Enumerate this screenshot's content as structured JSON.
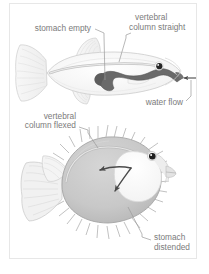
{
  "figure": {
    "frame_border_color": "#e7e7e7",
    "background_color": "#ffffff",
    "label_text_color": "#7b7b7b",
    "leader_line_color": "#9a9a9a",
    "labels": [
      {
        "id": "stomach-empty",
        "text": "stomach empty",
        "lines": [
          "stomach empty"
        ]
      },
      {
        "id": "vertebral-column-straight",
        "text": "vertebral column straight",
        "lines": [
          "vertebral",
          "column straight"
        ]
      },
      {
        "id": "water-flow",
        "text": "water flow",
        "lines": [
          "water flow"
        ]
      },
      {
        "id": "vertebral-column-flexed",
        "text": "vertebral column flexed",
        "lines": [
          "vertebral",
          "column flexed"
        ]
      },
      {
        "id": "stomach-distended",
        "text": "stomach distended",
        "lines": [
          "stomach",
          "distended"
        ]
      }
    ],
    "panels": [
      {
        "id": "uninflated-fish",
        "name": "uninflated pufferfish, lateral view",
        "body_fill": "#fbfbfb",
        "body_stroke": "#cfcfcf",
        "stomach_fill": "#5f5f5f",
        "eye_fill": "#2b2b2b",
        "state": "deflated"
      },
      {
        "id": "inflated-fish",
        "name": "inflated pufferfish with erect spines, lateral view",
        "body_fill": "#c9c9c9",
        "body_stroke": "#a8a8a8",
        "stomach_fill": "#fdfdfd",
        "eye_fill": "#1f1f1f",
        "spine_stroke": "#b4b4b4",
        "arrow_fill": "#4a4a4a",
        "state": "inflated"
      }
    ]
  }
}
